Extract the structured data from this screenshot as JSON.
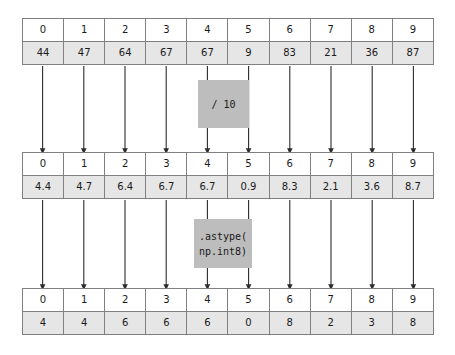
{
  "diagram": {
    "type": "numpy-array-transformation-flow",
    "arrays": [
      {
        "id": "array-top",
        "name": "source-array",
        "indices": [
          "0",
          "1",
          "2",
          "3",
          "4",
          "5",
          "6",
          "7",
          "8",
          "9"
        ],
        "values": [
          "44",
          "47",
          "64",
          "67",
          "67",
          "9",
          "83",
          "21",
          "36",
          "87"
        ]
      },
      {
        "id": "array-middle",
        "name": "divided-array",
        "indices": [
          "0",
          "1",
          "2",
          "3",
          "4",
          "5",
          "6",
          "7",
          "8",
          "9"
        ],
        "values": [
          "4.4",
          "4.7",
          "6.4",
          "6.7",
          "6.7",
          "0.9",
          "8.3",
          "2.1",
          "3.6",
          "8.7"
        ]
      },
      {
        "id": "array-bottom",
        "name": "casted-array",
        "indices": [
          "0",
          "1",
          "2",
          "3",
          "4",
          "5",
          "6",
          "7",
          "8",
          "9"
        ],
        "values": [
          "4",
          "4",
          "6",
          "6",
          "6",
          "0",
          "8",
          "2",
          "3",
          "8"
        ]
      }
    ],
    "operations": [
      {
        "id": "op-divide",
        "name": "divide-operation",
        "lines": [
          "/ 10"
        ]
      },
      {
        "id": "op-astype",
        "name": "astype-operation",
        "lines": [
          ".astype(",
          "np.int8)"
        ]
      }
    ],
    "colors": {
      "value_cell_background": "#e6e6e6",
      "index_cell_background": "#ffffff",
      "operation_box_background": "#bdbdbd",
      "border": "#808080",
      "arrow": "#2b2b2b",
      "text": "#1a1a1a"
    }
  }
}
